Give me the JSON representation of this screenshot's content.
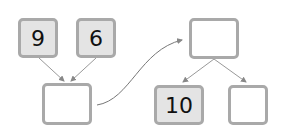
{
  "diagram": {
    "top_left_boxes": [
      {
        "value": "9"
      },
      {
        "value": "6"
      }
    ],
    "sum_box": {
      "value": ""
    },
    "split_top_box": {
      "value": ""
    },
    "split_parts": [
      {
        "value": "10"
      },
      {
        "value": ""
      }
    ],
    "colors": {
      "box_border": "#a9a9a9",
      "filled_bg": "#e4e4e4",
      "empty_bg": "#ffffff",
      "arrow": "#888888"
    }
  }
}
